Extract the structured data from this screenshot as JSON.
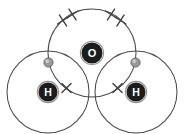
{
  "diagram": {
    "title": "Water molecule dot-and-cross diagram",
    "type": "dot-and-cross",
    "molecule_formula": "H2O",
    "canvas": {
      "width": 185,
      "height": 134,
      "background": "#ffffff"
    },
    "colors": {
      "shell_stroke": "#4a4a4a",
      "atom_fill": "#1c1c1c",
      "atom_text": "#ffffff",
      "dot_fill": "#9a9a9a",
      "dot_stroke": "#5c5c5c",
      "cross_stroke": "#3d3d3d"
    },
    "atoms": [
      {
        "id": "oxygen",
        "label": "O",
        "cx": 92,
        "cy": 53,
        "disc_r": 10.5,
        "shell_r": 44,
        "label_class": "label-o"
      },
      {
        "id": "hydrogen-left",
        "label": "H",
        "cx": 48,
        "cy": 92,
        "disc_r": 9.5,
        "shell_r": 41,
        "label_class": "label-h"
      },
      {
        "id": "hydrogen-right",
        "label": "H",
        "cx": 136,
        "cy": 92,
        "disc_r": 9.5,
        "shell_r": 41,
        "label_class": "label-h"
      }
    ],
    "electron_dots": [
      {
        "id": "dot-bond-left",
        "belongs_to": "hydrogen-left",
        "cx": 48.5,
        "cy": 62.5,
        "r": 4.6
      },
      {
        "id": "dot-bond-right",
        "belongs_to": "hydrogen-right",
        "cx": 135.5,
        "cy": 62.5,
        "r": 4.6
      }
    ],
    "electron_crosses": [
      {
        "id": "cross-lone-pair-1a",
        "belongs_to": "oxygen",
        "cx": 63,
        "cy": 20.5,
        "size": 4.6,
        "rot": 12
      },
      {
        "id": "cross-lone-pair-1b",
        "belongs_to": "oxygen",
        "cx": 72.5,
        "cy": 14.5,
        "size": 4.6,
        "rot": 12
      },
      {
        "id": "cross-lone-pair-2a",
        "belongs_to": "oxygen",
        "cx": 111,
        "cy": 14.5,
        "size": 4.6,
        "rot": -12
      },
      {
        "id": "cross-lone-pair-2b",
        "belongs_to": "oxygen",
        "cx": 120.5,
        "cy": 20.5,
        "size": 4.6,
        "rot": -12
      },
      {
        "id": "cross-bond-left",
        "belongs_to": "oxygen",
        "cx": 66.5,
        "cy": 88,
        "size": 4.6,
        "rot": 0
      },
      {
        "id": "cross-bond-right",
        "belongs_to": "oxygen",
        "cx": 117.5,
        "cy": 88,
        "size": 4.6,
        "rot": 0
      }
    ],
    "legend": {
      "dot_meaning": "hydrogen electron",
      "cross_meaning": "oxygen electron"
    }
  }
}
